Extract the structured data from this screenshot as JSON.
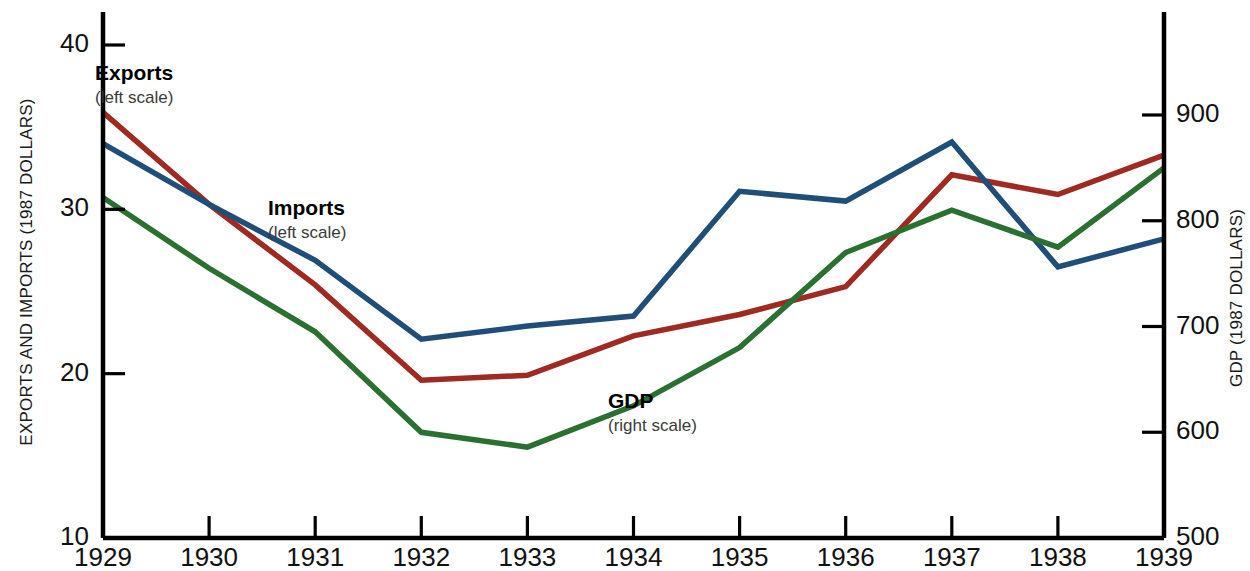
{
  "chart_data": {
    "type": "line",
    "title": "",
    "xlabel": "",
    "categories": [
      "1929",
      "1930",
      "1931",
      "1932",
      "1933",
      "1934",
      "1935",
      "1936",
      "1937",
      "1938",
      "1939"
    ],
    "left_axis": {
      "label": "EXPORTS AND IMPORTS (1987 DOLLARS)",
      "ticks": [
        10,
        20,
        30,
        40
      ],
      "tick_labels": [
        "10",
        "20",
        "30",
        "40"
      ],
      "ylim": [
        10,
        40
      ]
    },
    "right_axis": {
      "label": "GDP (1987 DOLLARS)",
      "ticks": [
        500,
        600,
        700,
        800,
        900
      ],
      "tick_labels": [
        "500",
        "600",
        "700",
        "800",
        "900"
      ],
      "ylim": [
        500,
        940
      ]
    },
    "grid": false,
    "legend_position": "inline-annotations",
    "series": [
      {
        "name": "Exports",
        "scale_note": "(left scale)",
        "axis": "left",
        "color": "#9e2a22",
        "values": [
          35.9,
          30.3,
          25.4,
          19.6,
          19.9,
          22.3,
          23.6,
          25.3,
          32.1,
          30.9,
          33.3
        ]
      },
      {
        "name": "Imports",
        "scale_note": "(left scale)",
        "axis": "left",
        "color": "#1f4e79",
        "values": [
          34.0,
          30.3,
          26.9,
          22.1,
          22.9,
          23.5,
          31.1,
          30.5,
          34.1,
          26.5,
          28.2
        ]
      },
      {
        "name": "GDP",
        "scale_note": "(right scale)",
        "axis": "right",
        "color": "#2a7030",
        "values": [
          822,
          755,
          695,
          600,
          586,
          625,
          680,
          770,
          810,
          775,
          850
        ]
      }
    ],
    "annotations": [
      {
        "name": "Exports",
        "scale_note": "(left scale)",
        "x_px": 95,
        "y_px": 62
      },
      {
        "name": "Imports",
        "scale_note": "(left scale)",
        "x_px": 268,
        "y_px": 197
      },
      {
        "name": "GDP",
        "scale_note": "(right scale)",
        "x_px": 608,
        "y_px": 390
      }
    ]
  },
  "axes": {
    "left_title": "EXPORTS AND IMPORTS (1987 DOLLARS)",
    "right_title": "GDP (1987 DOLLARS)",
    "left_ticks": [
      "40",
      "30",
      "20",
      "10"
    ],
    "right_ticks": [
      "900",
      "800",
      "700",
      "600",
      "500"
    ],
    "x_ticks": [
      "1929",
      "1930",
      "1931",
      "1932",
      "1933",
      "1934",
      "1935",
      "1936",
      "1937",
      "1938",
      "1939"
    ]
  },
  "annotations": {
    "exports": {
      "name": "Exports",
      "scale": "(left scale)"
    },
    "imports": {
      "name": "Imports",
      "scale": "(left scale)"
    },
    "gdp": {
      "name": "GDP",
      "scale": "(right scale)"
    }
  }
}
